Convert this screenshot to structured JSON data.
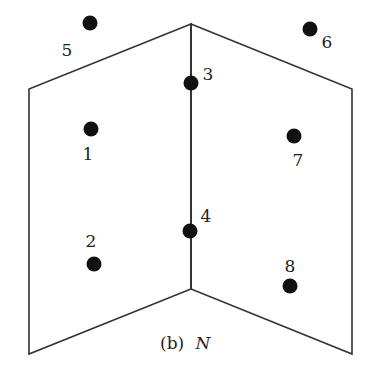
{
  "diagram": {
    "caption_prefix": "(b)",
    "caption_symbol": "N",
    "planes": [
      {
        "name": "left-plane",
        "points": [
          [
            191,
            24
          ],
          [
            29,
            89
          ],
          [
            29,
            354
          ],
          [
            191,
            289
          ]
        ]
      },
      {
        "name": "right-plane",
        "points": [
          [
            191,
            24
          ],
          [
            352,
            89
          ],
          [
            352,
            354
          ],
          [
            191,
            289
          ]
        ]
      }
    ],
    "fold_line": {
      "x1": 191,
      "y1": 24,
      "x2": 191,
      "y2": 289
    },
    "points": [
      {
        "id": "1",
        "label": "1",
        "x": 91,
        "y": 129,
        "lx": 88,
        "ly": 160
      },
      {
        "id": "2",
        "label": "2",
        "x": 94,
        "y": 264,
        "lx": 91,
        "ly": 247
      },
      {
        "id": "3",
        "label": "3",
        "x": 191,
        "y": 83,
        "lx": 208,
        "ly": 80
      },
      {
        "id": "4",
        "label": "4",
        "x": 190,
        "y": 231,
        "lx": 206,
        "ly": 222
      },
      {
        "id": "5",
        "label": "5",
        "x": 90,
        "y": 23,
        "lx": 67,
        "ly": 56
      },
      {
        "id": "6",
        "label": "6",
        "x": 310,
        "y": 29,
        "lx": 327,
        "ly": 48
      },
      {
        "id": "7",
        "label": "7",
        "x": 294,
        "y": 136,
        "lx": 298,
        "ly": 166
      },
      {
        "id": "8",
        "label": "8",
        "x": 290,
        "y": 286,
        "lx": 290,
        "ly": 272
      }
    ],
    "colors": {
      "line": "#333333",
      "point": "#111111"
    }
  }
}
